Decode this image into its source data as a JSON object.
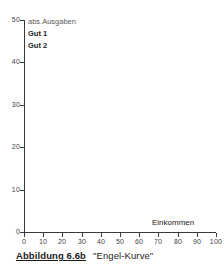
{
  "figure": {
    "caption_ref": "Abbildung 6.6b",
    "caption_title": "\"Engel-Kurve\""
  },
  "chart_data": {
    "type": "line",
    "title": "\"Engel-Kurve\"",
    "subtitle": "",
    "xlabel": "Einkommen",
    "ylabel": "abs.Ausgaben",
    "xlim": [
      0,
      100
    ],
    "ylim": [
      0,
      50
    ],
    "xticks": [
      0,
      10,
      20,
      30,
      40,
      50,
      60,
      70,
      80,
      90,
      100
    ],
    "yticks": [
      0,
      10,
      20,
      30,
      40,
      50
    ],
    "xtick_labels": [
      "0",
      "10",
      "20",
      "30",
      "40",
      "50",
      "60",
      "70",
      "80",
      "90",
      "100"
    ],
    "ytick_labels": [
      "0",
      "10",
      "20",
      "30",
      "40",
      "50"
    ],
    "grid": false,
    "legend_position": "top-left-inside",
    "series": [
      {
        "name": "Gut 1",
        "values": []
      },
      {
        "name": "Gut 2",
        "values": []
      }
    ],
    "annotations": []
  },
  "colors": {
    "axis": "#3a3a3a",
    "text": "#1c1c1c",
    "tick_text": "#3d3d3d",
    "muted_text": "#5a5a5a",
    "background": "#ffffff"
  }
}
